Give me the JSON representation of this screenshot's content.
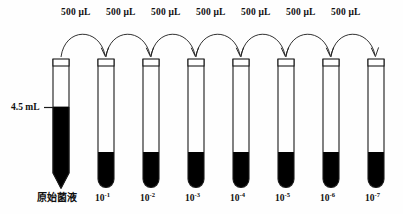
{
  "figure": {
    "background_color": "#fefefe",
    "line_color": "#1a1a1a",
    "liquid_color": "#000000"
  },
  "volume_labels": [
    {
      "text": "500 μL"
    },
    {
      "text": "500 μL"
    },
    {
      "text": "500 μL"
    },
    {
      "text": "500 μL"
    },
    {
      "text": "500 μL"
    },
    {
      "text": "500 μL"
    },
    {
      "text": "500 μL"
    }
  ],
  "volume_marker": {
    "text": "4.5 mL"
  },
  "tubes": [
    {
      "label_main": "原始菌液",
      "label_base": "",
      "label_exp": "",
      "bottom": "conical",
      "fill_top_y": 107
    },
    {
      "label_main": "",
      "label_base": "10",
      "label_exp": "-1",
      "bottom": "round",
      "fill_top_y": 152
    },
    {
      "label_main": "",
      "label_base": "10",
      "label_exp": "-2",
      "bottom": "round",
      "fill_top_y": 152
    },
    {
      "label_main": "",
      "label_base": "10",
      "label_exp": "-3",
      "bottom": "round",
      "fill_top_y": 152
    },
    {
      "label_main": "",
      "label_base": "10",
      "label_exp": "-4",
      "bottom": "round",
      "fill_top_y": 152
    },
    {
      "label_main": "",
      "label_base": "10",
      "label_exp": "-5",
      "bottom": "round",
      "fill_top_y": 152
    },
    {
      "label_main": "",
      "label_base": "10",
      "label_exp": "-6",
      "bottom": "round",
      "fill_top_y": 152
    },
    {
      "label_main": "",
      "label_base": "10",
      "label_exp": "-7",
      "bottom": "round",
      "fill_top_y": 152
    }
  ]
}
